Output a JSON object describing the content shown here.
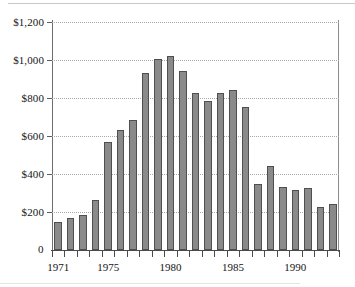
{
  "chart_data": {
    "type": "bar",
    "title": "",
    "subtitle": "",
    "xlabel": "",
    "ylabel": "",
    "categories": [
      1971,
      1972,
      1973,
      1974,
      1975,
      1976,
      1977,
      1978,
      1979,
      1980,
      1981,
      1982,
      1983,
      1984,
      1985,
      1986,
      1987,
      1988,
      1989,
      1990,
      1991,
      1992,
      1993
    ],
    "values": [
      150,
      170,
      185,
      265,
      570,
      630,
      685,
      930,
      1005,
      1020,
      940,
      825,
      785,
      825,
      840,
      755,
      345,
      440,
      330,
      315,
      325,
      225,
      240
    ],
    "series": [
      {
        "name": "Value",
        "values": [
          150,
          170,
          185,
          265,
          570,
          630,
          685,
          930,
          1005,
          1020,
          940,
          825,
          785,
          825,
          840,
          755,
          345,
          440,
          330,
          315,
          325,
          225,
          240
        ]
      }
    ],
    "ylim": [
      0,
      1200
    ],
    "ytick_values": [
      0,
      200,
      400,
      600,
      800,
      1000,
      1200
    ],
    "ytick_labels": [
      "0",
      "$200",
      "$400",
      "$600",
      "$800",
      "$1,000",
      "$1,200"
    ],
    "xtick_labels": [
      "1971",
      "1975",
      "1980",
      "1985",
      "1990"
    ],
    "xtick_label_years": [
      1971,
      1975,
      1980,
      1985,
      1990
    ],
    "grid": true,
    "grid_style": "dotted-horizontal",
    "legend": "none",
    "bar_color": "#8a8a8a",
    "bar_edge_color": "#4f4f4f",
    "grid_color": "#a9a9a9",
    "axis_color": "#4a4a4a",
    "background_color": "#ffffff",
    "text_color": "#141414"
  }
}
